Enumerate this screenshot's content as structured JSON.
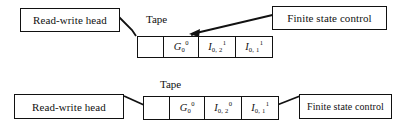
{
  "figure": {
    "type": "turing-machine-diagram",
    "background_color": "#ffffff",
    "line_color": "#111111",
    "rows": [
      {
        "id": "top",
        "read_write_head_label": "Read-write head",
        "tape_label": "Tape",
        "finite_state_control_label": "Finite state control",
        "cells": [
          {
            "text": "",
            "base": "",
            "sub": "",
            "sup": ""
          },
          {
            "text": "G0^0",
            "base": "G",
            "sub": "0",
            "sup": "0"
          },
          {
            "text": "I0,2^1",
            "base": "I",
            "sub": "0, 2",
            "sup": "1"
          },
          {
            "text": "I0,1^1",
            "base": "I",
            "sub": "0, 1",
            "sup": "1"
          }
        ]
      },
      {
        "id": "bottom",
        "read_write_head_label": "Read-write head",
        "tape_label": "Tape",
        "finite_state_control_label": "Finite state control",
        "cells": [
          {
            "text": "",
            "base": "",
            "sub": "",
            "sup": ""
          },
          {
            "text": "G0^0",
            "base": "G",
            "sub": "0",
            "sup": "0"
          },
          {
            "text": "I0,2^0",
            "base": "I",
            "sub": "0, 2",
            "sup": "0"
          },
          {
            "text": "I0,1^1",
            "base": "I",
            "sub": "0, 1",
            "sup": "1"
          }
        ]
      }
    ]
  }
}
